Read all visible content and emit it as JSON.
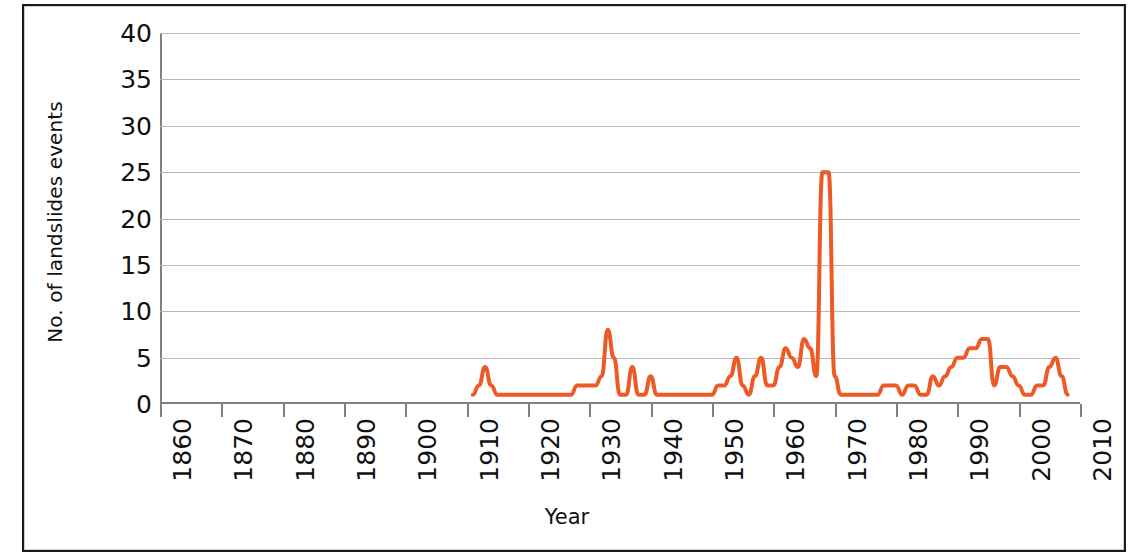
{
  "chart_data": {
    "type": "line",
    "title": "",
    "xlabel": "Year",
    "ylabel": "No. of landslides events",
    "xlim": [
      1860,
      2010
    ],
    "ylim": [
      0,
      40
    ],
    "xticks": [
      1860,
      1870,
      1880,
      1890,
      1900,
      1910,
      1920,
      1930,
      1940,
      1950,
      1960,
      1970,
      1980,
      1990,
      2000,
      2010
    ],
    "yticks": [
      0,
      5,
      10,
      15,
      20,
      25,
      30,
      35,
      40
    ],
    "grid": "horizontal",
    "legend": "none",
    "line_color": "#ed5a26",
    "line_width": 4,
    "series": [
      {
        "name": "No. of landslides events",
        "x": [
          1911,
          1912,
          1913,
          1914,
          1915,
          1916,
          1917,
          1918,
          1919,
          1920,
          1921,
          1922,
          1923,
          1924,
          1925,
          1926,
          1927,
          1928,
          1929,
          1930,
          1931,
          1932,
          1933,
          1934,
          1935,
          1936,
          1937,
          1938,
          1939,
          1940,
          1941,
          1942,
          1943,
          1944,
          1945,
          1946,
          1947,
          1948,
          1949,
          1950,
          1951,
          1952,
          1953,
          1954,
          1955,
          1956,
          1957,
          1958,
          1959,
          1960,
          1961,
          1962,
          1963,
          1964,
          1965,
          1966,
          1967,
          1968,
          1969,
          1970,
          1971,
          1972,
          1973,
          1974,
          1975,
          1976,
          1977,
          1978,
          1979,
          1980,
          1981,
          1982,
          1983,
          1984,
          1985,
          1986,
          1987,
          1988,
          1989,
          1990,
          1991,
          1992,
          1993,
          1994,
          1995,
          1996,
          1997,
          1998,
          1999,
          2000,
          2001,
          2002,
          2003,
          2004,
          2005,
          2006,
          2007,
          2008
        ],
        "y": [
          1,
          2,
          4,
          2,
          1,
          1,
          1,
          1,
          1,
          1,
          1,
          1,
          1,
          1,
          1,
          1,
          1,
          2,
          2,
          2,
          2,
          3,
          8,
          5,
          1,
          1,
          4,
          1,
          1,
          3,
          1,
          1,
          1,
          1,
          1,
          1,
          1,
          1,
          1,
          1,
          2,
          2,
          3,
          5,
          2,
          1,
          3,
          5,
          2,
          2,
          4,
          6,
          5,
          4,
          7,
          6,
          3,
          25,
          25,
          3,
          1,
          1,
          1,
          1,
          1,
          1,
          1,
          2,
          2,
          2,
          1,
          2,
          2,
          1,
          1,
          3,
          2,
          3,
          4,
          5,
          5,
          6,
          6,
          7,
          7,
          2,
          4,
          4,
          3,
          2,
          1,
          1,
          2,
          2,
          4,
          5,
          3,
          1
        ]
      }
    ]
  },
  "axes": {
    "ylabel": "No. of landslides events",
    "xlabel": "Year",
    "ytick_labels": [
      "40",
      "35",
      "30",
      "25",
      "20",
      "15",
      "10",
      "5",
      "0"
    ],
    "xtick_labels": [
      "1860",
      "1870",
      "1880",
      "1890",
      "1900",
      "1910",
      "1920",
      "1930",
      "1940",
      "1950",
      "1960",
      "1970",
      "1980",
      "1990",
      "2000",
      "2010"
    ]
  },
  "colors": {
    "line": "#ed5a26",
    "grid": "#b9b9b9",
    "axis": "#808080",
    "text": "#111111",
    "frame": "#1a1a1a"
  }
}
